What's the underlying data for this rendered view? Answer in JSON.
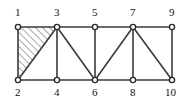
{
  "figure": {
    "name": "truss-structure-diagram",
    "type": "structural-truss",
    "width": 190,
    "height": 102,
    "background_color": "#ffffff",
    "line_color": "#3a3a3a",
    "node_fill_color": "#ffffff",
    "node_stroke_color": "#2b2b2b",
    "label_color": "#111111",
    "hatch_color": "#5a5a5a"
  },
  "nodes": [
    {
      "id": "1",
      "label": "1",
      "x": 18,
      "y": 27,
      "label_x": 15,
      "label_y": 16,
      "row": "top"
    },
    {
      "id": "2",
      "label": "2",
      "x": 18,
      "y": 80,
      "label_x": 15,
      "label_y": 96,
      "row": "bottom"
    },
    {
      "id": "3",
      "label": "3",
      "x": 57,
      "y": 27,
      "label_x": 54,
      "label_y": 16,
      "row": "top"
    },
    {
      "id": "4",
      "label": "4",
      "x": 57,
      "y": 80,
      "label_x": 54,
      "label_y": 96,
      "row": "bottom"
    },
    {
      "id": "5",
      "label": "5",
      "x": 95,
      "y": 27,
      "label_x": 92,
      "label_y": 16,
      "row": "top"
    },
    {
      "id": "6",
      "label": "6",
      "x": 95,
      "y": 80,
      "label_x": 92,
      "label_y": 96,
      "row": "bottom"
    },
    {
      "id": "7",
      "label": "7",
      "x": 133,
      "y": 27,
      "label_x": 130,
      "label_y": 16,
      "row": "top"
    },
    {
      "id": "8",
      "label": "8",
      "x": 133,
      "y": 80,
      "label_x": 130,
      "label_y": 96,
      "row": "bottom"
    },
    {
      "id": "9",
      "label": "9",
      "x": 172,
      "y": 27,
      "label_x": 169,
      "label_y": 16,
      "row": "top"
    },
    {
      "id": "10",
      "label": "10",
      "x": 172,
      "y": 80,
      "label_x": 165,
      "label_y": 96,
      "row": "bottom"
    }
  ],
  "members": [
    {
      "name": "chord-top-1-3",
      "from": "1",
      "to": "3",
      "kind": "top-chord"
    },
    {
      "name": "chord-top-3-5",
      "from": "3",
      "to": "5",
      "kind": "top-chord"
    },
    {
      "name": "chord-top-5-7",
      "from": "5",
      "to": "7",
      "kind": "top-chord"
    },
    {
      "name": "chord-top-7-9",
      "from": "7",
      "to": "9",
      "kind": "top-chord"
    },
    {
      "name": "chord-bottom-2-4",
      "from": "2",
      "to": "4",
      "kind": "bottom-chord"
    },
    {
      "name": "chord-bottom-4-6",
      "from": "4",
      "to": "6",
      "kind": "bottom-chord"
    },
    {
      "name": "chord-bottom-6-8",
      "from": "6",
      "to": "8",
      "kind": "bottom-chord"
    },
    {
      "name": "chord-bottom-8-10",
      "from": "8",
      "to": "10",
      "kind": "bottom-chord"
    },
    {
      "name": "post-1-2",
      "from": "1",
      "to": "2",
      "kind": "vertical"
    },
    {
      "name": "post-3-4",
      "from": "3",
      "to": "4",
      "kind": "vertical"
    },
    {
      "name": "post-5-6",
      "from": "5",
      "to": "6",
      "kind": "vertical"
    },
    {
      "name": "post-7-8",
      "from": "7",
      "to": "8",
      "kind": "vertical"
    },
    {
      "name": "post-9-10",
      "from": "9",
      "to": "10",
      "kind": "vertical"
    },
    {
      "name": "diagonal-2-3",
      "from": "2",
      "to": "3",
      "kind": "diagonal"
    },
    {
      "name": "diagonal-3-6",
      "from": "3",
      "to": "6",
      "kind": "diagonal"
    },
    {
      "name": "diagonal-6-7",
      "from": "6",
      "to": "7",
      "kind": "diagonal"
    },
    {
      "name": "diagonal-7-10",
      "from": "7",
      "to": "10",
      "kind": "diagonal"
    }
  ],
  "hatched_regions": [
    {
      "name": "hatched-panel-1-2-3",
      "vertices": [
        "1",
        "2",
        "3"
      ],
      "pattern": "diagonal-lines-45",
      "direction": "lower-left-to-upper-right"
    }
  ]
}
